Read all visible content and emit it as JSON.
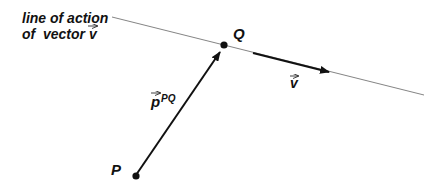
{
  "diagram": {
    "caption_line1": "line of action",
    "caption_line2": "of  vector",
    "caption_vector": "v",
    "point_p": "P",
    "point_q": "Q",
    "vector_v": "v",
    "vector_p": "p",
    "vector_p_superscript": "PQ",
    "colors": {
      "ink": "#111111",
      "line": "#777777",
      "background": "#ffffff"
    }
  }
}
